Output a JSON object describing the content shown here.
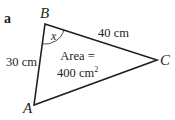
{
  "figure": {
    "part_label": "a",
    "vertices": {
      "A": {
        "label": "A",
        "x": 34,
        "y": 105
      },
      "B": {
        "label": "B",
        "x": 45,
        "y": 24
      },
      "C": {
        "label": "C",
        "x": 157,
        "y": 60
      }
    },
    "sides": {
      "AB": {
        "label": "30 cm"
      },
      "BC": {
        "label": "40 cm"
      }
    },
    "angle": {
      "vertex": "B",
      "label": "x"
    },
    "area": {
      "line1": "Area =",
      "line2_value": "400 cm",
      "line2_exp": "2"
    },
    "colors": {
      "stroke": "#231f20",
      "text": "#231f20",
      "background": "#ffffff"
    }
  }
}
